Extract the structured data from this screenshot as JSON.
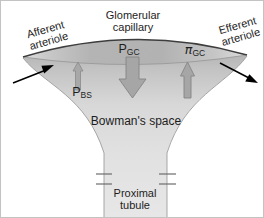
{
  "labels": {
    "afferent_line1": "Afferent",
    "afferent_line2": "arteriole",
    "efferent_line1": "Efferent",
    "efferent_line2": "arteriole",
    "glomerular_line1": "Glomerular",
    "glomerular_line2": "capillary",
    "bowmans_space": "Bowman's space",
    "proximal_line1": "Proximal",
    "proximal_line2": "tubule"
  },
  "symbols": {
    "pgc_base": "P",
    "pgc_sub": "GC",
    "pigc_base": "π",
    "pigc_sub": "GC",
    "pbs_base": "P",
    "pbs_sub": "BS"
  },
  "colors": {
    "background": "#ffffff",
    "border": "#c3c3c3",
    "capillary_band_mid": "#b4b4b4",
    "capillary_band_end": "#dcdcdc",
    "capillary_outline": "#3f3f3f",
    "bowmans_space_top": "#b5b5b5",
    "bowmans_space_bottom": "#e6e6e6",
    "tubule_outline": "#9a9a9a",
    "pressure_arrow_fill": "#a6a6a6",
    "pressure_arrow_stroke": "#858585",
    "flow_arrow": "#000000",
    "text": "#1d1d1d"
  }
}
